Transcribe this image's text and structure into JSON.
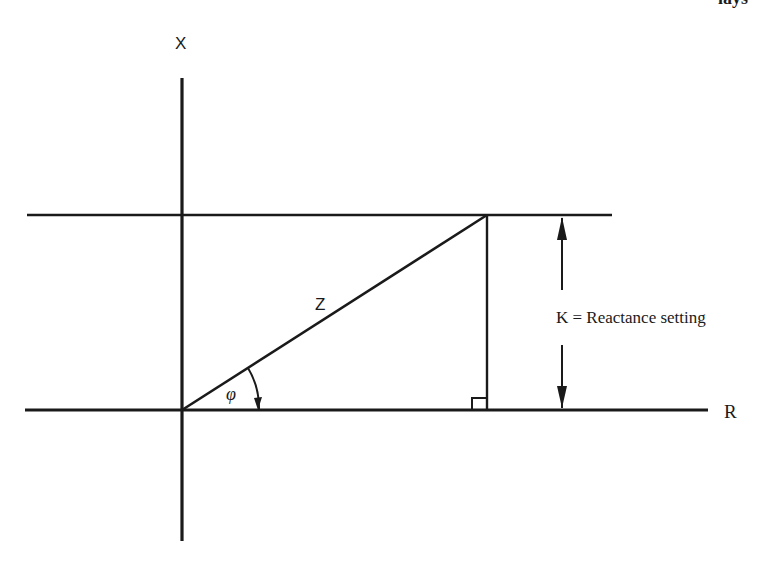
{
  "header": {
    "fragment_text": "lays"
  },
  "diagram": {
    "x_axis_label": "X",
    "r_axis_label": "R",
    "impedance_label": "Z",
    "angle_label": "φ",
    "reactance_label": "K = Reactance setting",
    "line_color": "#1a1a1a",
    "background": "#ffffff"
  }
}
